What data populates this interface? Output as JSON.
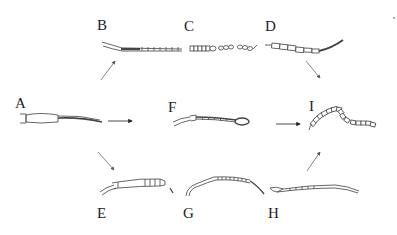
{
  "figure": {
    "panels": [
      {
        "id": "A",
        "label": "A",
        "description": "base form: short scape/pedicel with long tapering dark flagellum"
      },
      {
        "id": "B",
        "label": "B",
        "description": "elongate form with fine annulated flagellum and bristles"
      },
      {
        "id": "C",
        "label": "C",
        "description": "beaded/moniliform segmented form"
      },
      {
        "id": "D",
        "label": "D",
        "description": "long rectangular-segmented curved form"
      },
      {
        "id": "E",
        "label": "E",
        "description": "short form with few terminal segments"
      },
      {
        "id": "F",
        "label": "F",
        "description": "form with twisted shaft ending in loop/club"
      },
      {
        "id": "G",
        "label": "G",
        "description": "long curved finely segmented form"
      },
      {
        "id": "H",
        "label": "H",
        "description": "long slender gently curved form"
      },
      {
        "id": "I",
        "label": "I",
        "description": "bent chain of rectangular segments"
      }
    ],
    "arrows": [
      {
        "from": "A",
        "to": "B"
      },
      {
        "from": "A",
        "to": "F"
      },
      {
        "from": "A",
        "to": "E"
      },
      {
        "from": "D",
        "to": "I"
      },
      {
        "from": "F",
        "to": "I"
      },
      {
        "from": "H",
        "to": "I"
      }
    ],
    "colors": {
      "background": "#ffffff",
      "line": "#444444",
      "arrow": "#666666",
      "label": "#222222"
    }
  }
}
